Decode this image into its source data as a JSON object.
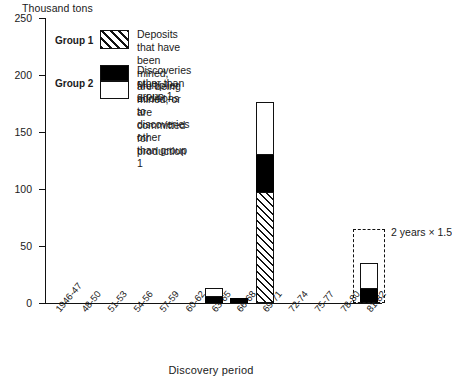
{
  "chart_data": {
    "type": "bar",
    "title": "",
    "ylabel": "Thousand tons",
    "xlabel": "Discovery period",
    "ylim": [
      0,
      250
    ],
    "yticks": [
      0,
      50,
      100,
      150,
      200,
      250
    ],
    "grid": false,
    "stacked": true,
    "legend_position": "inside-top-left",
    "categories": [
      "1946-47",
      "48-50",
      "51-53",
      "54-56",
      "57-59",
      "60-62",
      "63-65",
      "66-68",
      "69-71",
      "72-74",
      "75-77",
      "78-80",
      "81-82"
    ],
    "series": [
      {
        "name": "Group 1",
        "description": "Deposits that have been mined, are being mined, or are committed for production",
        "pattern": "diagonal-hatch",
        "values": [
          0,
          0,
          0,
          0,
          0,
          0,
          0,
          0,
          97,
          0,
          0,
          0,
          0
        ]
      },
      {
        "name": "Group 2 - discoveries",
        "description": "Discoveries other than group 1",
        "pattern": "solid-black",
        "values": [
          0,
          0,
          0,
          0,
          0,
          0,
          5,
          4,
          33,
          0,
          0,
          0,
          12
        ]
      },
      {
        "name": "Group 2 - multiplier",
        "description": "Multiplier additions to discoveries other than group 1",
        "pattern": "open-white",
        "values": [
          0,
          0,
          0,
          0,
          0,
          0,
          8,
          0,
          46,
          0,
          0,
          0,
          23
        ]
      }
    ],
    "annotations": [
      {
        "text": "2 years  ×  1.5",
        "category": "81-82",
        "extension_top": 65,
        "style": "dashed-outline"
      }
    ]
  },
  "legend": {
    "entries": [
      {
        "group_label": "Group 1",
        "swatch": "diagonal-hatch",
        "text": "Deposits that have been mined, are being\nmined, or are committed for production"
      },
      {
        "group_label": "Group 2",
        "swatch_top": "solid-black",
        "swatch_bottom": "open-white",
        "text_top": "Discoveries other than group 1",
        "text_bottom": "Multiplier additions to discoveries other\nthan group 1"
      }
    ]
  }
}
